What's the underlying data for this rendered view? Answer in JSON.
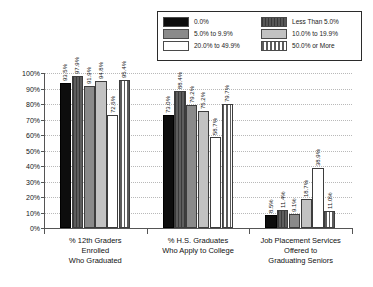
{
  "chart_data": {
    "type": "bar",
    "title": "",
    "xlabel": "",
    "ylabel": "",
    "ylim": [
      0,
      100
    ],
    "grid": true,
    "legend_position": "top-right",
    "categories": [
      "% 12th Graders\nEnrolled\nWho Graduated",
      "% H.S. Graduates\nWho Apply to College",
      "Job Placement Services\nOffered to\nGraduating Seniors"
    ],
    "ytick_labels": [
      "100%",
      "90%",
      "80%",
      "70%",
      "60%",
      "50%",
      "40%",
      "30%",
      "20%",
      "10%",
      "0%"
    ],
    "ytick_values": [
      100,
      90,
      80,
      70,
      60,
      50,
      40,
      30,
      20,
      10,
      0
    ],
    "series": [
      {
        "name": "0.0%",
        "swatch": "black",
        "values": [
          93.5,
          73.0,
          8.5
        ],
        "labels": [
          "93.5%",
          "73.0%",
          "8.5%"
        ]
      },
      {
        "name": "Less Than 5.0%",
        "swatch": "dkgray",
        "values": [
          97.9,
          88.4,
          11.4
        ],
        "labels": [
          "97.9%",
          "88.4%",
          "11.4%"
        ]
      },
      {
        "name": "5.0% to 9.9%",
        "swatch": "medgray",
        "values": [
          91.9,
          79.2,
          9.1
        ],
        "labels": [
          "91.9%",
          "79.2%",
          "9.1%"
        ]
      },
      {
        "name": "10.0% to 19.9%",
        "swatch": "ltgray",
        "values": [
          94.8,
          75.2,
          18.7
        ],
        "labels": [
          "94.8%",
          "75.2%",
          "18.7%"
        ]
      },
      {
        "name": "20.0% to 49.9%",
        "swatch": "white",
        "values": [
          72.6,
          58.7,
          38.9
        ],
        "labels": [
          "72.6%",
          "58.7%",
          "38.9%"
        ]
      },
      {
        "name": "50.0% or More",
        "swatch": "vstripe",
        "values": [
          95.4,
          79.7,
          11.0
        ],
        "labels": [
          "95.4%",
          "79.7%",
          "11.0%"
        ]
      }
    ],
    "legend_order": [
      {
        "col": 0,
        "row": 0,
        "name": "0.0%"
      },
      {
        "col": 0,
        "row": 1,
        "name": "5.0% to 9.9%"
      },
      {
        "col": 0,
        "row": 2,
        "name": "20.0% to 49.9%"
      },
      {
        "col": 1,
        "row": 0,
        "name": "Less Than 5.0%"
      },
      {
        "col": 1,
        "row": 1,
        "name": "10.0% to 19.9%"
      },
      {
        "col": 1,
        "row": 2,
        "name": "50.0% or More"
      }
    ]
  },
  "legend": {
    "left_items": [
      {
        "label": "0.0%",
        "swatch": "black"
      },
      {
        "label": "5.0% to 9.9%",
        "swatch": "medgray"
      },
      {
        "label": "20.0% to 49.9%",
        "swatch": "white"
      }
    ],
    "right_items": [
      {
        "label": "Less Than 5.0%",
        "swatch": "dkgray"
      },
      {
        "label": "10.0% to 19.9%",
        "swatch": "ltgray"
      },
      {
        "label": "50.0% or More",
        "swatch": "vstripe"
      }
    ]
  }
}
